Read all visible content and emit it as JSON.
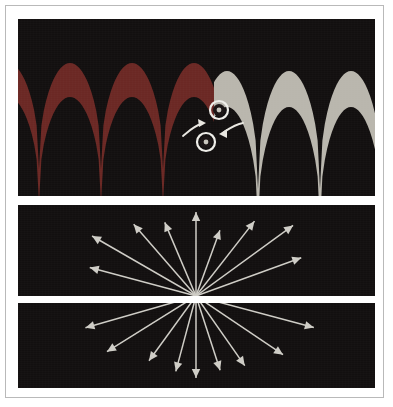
{
  "figure": {
    "background_color": "#ffffff",
    "frame_color": "#b9b9b9",
    "panel_background": "#120f0f"
  },
  "panels": [
    {
      "id": "wave-panel",
      "name": "interference-wave-panel",
      "x": 18,
      "y": 19,
      "width": 357,
      "height": 177,
      "left_band_color": "#6b2824",
      "right_band_color": "#b9b6ad",
      "description": "Two sets of cusped wave bands meeting at center",
      "left_waves": {
        "color": "#6b2824",
        "count": 3,
        "period": 62,
        "start_x": -10,
        "cusp_y": 44,
        "trough_y": 150,
        "band_thickness": 34
      },
      "right_waves": {
        "color": "#b9b6ad",
        "count": 3,
        "period": 62,
        "start_x": 196,
        "cusp_y": 170,
        "crest_y": 52,
        "band_thickness": 36
      },
      "markers": [
        {
          "name": "upper-node-marker",
          "cx": 201,
          "cy": 91,
          "outer_r": 9,
          "inner_r": 5,
          "ring_color": "#efeee9",
          "core_color": "#1a1414",
          "dot_color": "#c9c6bd"
        },
        {
          "name": "lower-node-marker",
          "cx": 188,
          "cy": 123,
          "outer_r": 9,
          "inner_r": 5,
          "ring_color": "#efeee9",
          "core_color": "#1a1414",
          "dot_color": "#c9c6bd"
        }
      ],
      "arrows": [
        {
          "name": "left-curved-arrow",
          "color": "#e9e7e1",
          "path": "M 165 117 C 171 112 176 107 183 105",
          "head": [
            183,
            105
          ]
        },
        {
          "name": "right-curved-arrow",
          "color": "#e9e7e1",
          "path": "M 225 104 C 218 105 212 109 206 113",
          "head": [
            206,
            113
          ]
        }
      ]
    },
    {
      "id": "rays-up-panel",
      "name": "upward-ray-burst-panel",
      "x": 18,
      "y": 205,
      "width": 357,
      "height": 91,
      "ray_color": "#cfcdc6",
      "origin": {
        "x": 178,
        "y": 91
      },
      "ray_count": 9,
      "rays": [
        {
          "angle_deg": 165,
          "length": 110
        },
        {
          "angle_deg": 150,
          "length": 120
        },
        {
          "angle_deg": 131,
          "length": 95
        },
        {
          "angle_deg": 113,
          "length": 80
        },
        {
          "angle_deg": 90,
          "length": 84
        },
        {
          "angle_deg": 70,
          "length": 70
        },
        {
          "angle_deg": 52,
          "length": 95
        },
        {
          "angle_deg": 36,
          "length": 120
        },
        {
          "angle_deg": 20,
          "length": 112
        }
      ]
    },
    {
      "id": "rays-down-panel",
      "name": "downward-ray-burst-panel",
      "x": 18,
      "y": 303,
      "width": 357,
      "height": 85,
      "ray_color": "#cfcdc6",
      "origin": {
        "x": 178,
        "y": -7
      },
      "ray_count": 9,
      "rays": [
        {
          "angle_deg": 196,
          "length": 115
        },
        {
          "angle_deg": 212,
          "length": 105
        },
        {
          "angle_deg": 234,
          "length": 80
        },
        {
          "angle_deg": 255,
          "length": 78
        },
        {
          "angle_deg": 270,
          "length": 82
        },
        {
          "angle_deg": 288,
          "length": 78
        },
        {
          "angle_deg": 305,
          "length": 85
        },
        {
          "angle_deg": 326,
          "length": 105
        },
        {
          "angle_deg": 345,
          "length": 122
        }
      ]
    }
  ]
}
